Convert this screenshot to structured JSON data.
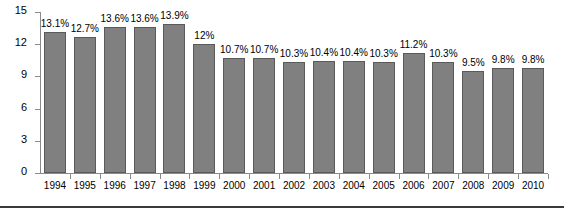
{
  "chart_data": {
    "type": "bar",
    "title": "",
    "xlabel": "",
    "ylabel": "Percent",
    "ylim": [
      0,
      15
    ],
    "yticks": [
      0,
      3,
      6,
      9,
      12,
      15
    ],
    "ytick_labels": [
      "0",
      "3",
      "6",
      "9",
      "12",
      "15"
    ],
    "grid": false,
    "legend": null,
    "bar_color": "#808080",
    "bar_edge_color": "#5a5a5a",
    "background_color": "#ffffff",
    "axis_color": "#8a8a8a",
    "categories": [
      "1994",
      "1995",
      "1996",
      "1997",
      "1998",
      "1999",
      "2000",
      "2001",
      "2002",
      "2003",
      "2004",
      "2005",
      "2006",
      "2007",
      "2008",
      "2009",
      "2010"
    ],
    "values": [
      13.1,
      12.7,
      13.6,
      13.6,
      13.9,
      12.0,
      10.7,
      10.7,
      10.3,
      10.4,
      10.4,
      10.3,
      11.2,
      10.3,
      9.5,
      9.8,
      9.8
    ],
    "data_labels": [
      "13.1%",
      "12.7%",
      "13.6%",
      "13.6%",
      "13.9%",
      "12%",
      "10.7%",
      "10.7%",
      "10.3%",
      "10.4%",
      "10.4%",
      "10.3%",
      "11.2%",
      "10.3%",
      "9.5%",
      "9.8%",
      "9.8%"
    ]
  }
}
